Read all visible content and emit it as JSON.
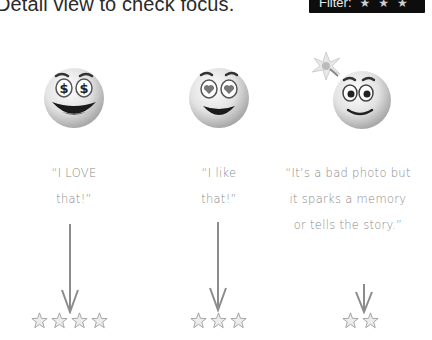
{
  "header": {
    "title": "Detail view to check focus.",
    "filter": {
      "label": "Filter:",
      "star_glyph": "★",
      "star_count": 3,
      "background": "#0d0d0d"
    }
  },
  "columns": [
    {
      "face_icon": "dollar-eyes-emoji",
      "quote_lines": [
        "“I LOVE",
        "that!”"
      ],
      "stars": 4
    },
    {
      "face_icon": "heart-eyes-emoji",
      "quote_lines": [
        "“I like",
        "that!”"
      ],
      "stars": 3
    },
    {
      "face_icon": "lightbulb-idea-emoji",
      "quote_lines": [
        "“It’s a bad photo but",
        "it sparks a memory",
        "or tells the story.”"
      ],
      "stars": 2
    }
  ],
  "colors": {
    "text": "#8a8a8a",
    "arrow": "#8c8c8c",
    "title": "#2a2a2a"
  }
}
